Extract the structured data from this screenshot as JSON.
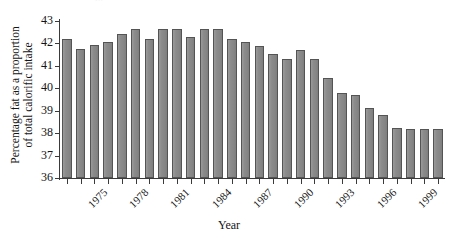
{
  "figure": {
    "top_remnant_text": "···",
    "background_color": "#ffffff",
    "bar_fill_color": "#8d8d8d",
    "bar_border_color": "#545454",
    "axis_color": "#3a3a3a"
  },
  "axis_titles": {
    "y_line1": "Percentage fat as a proportion",
    "y_line2": "of total calorific intake",
    "x": "Year"
  },
  "chart_data": {
    "type": "bar",
    "title": "",
    "subtitle": "",
    "xlabel": "Year",
    "ylabel": "Percentage fat as a proportion of total calorific intake",
    "ylim": [
      36,
      43
    ],
    "yticks": [
      36,
      37,
      38,
      39,
      40,
      41,
      42,
      43
    ],
    "ytick_labels": [
      "36",
      "37",
      "38",
      "39",
      "40",
      "41",
      "42",
      "43"
    ],
    "grid": false,
    "legend": null,
    "legend_position": "none",
    "xtick_labels_shown": [
      "1975",
      "1978",
      "1981",
      "1984",
      "1987",
      "1990",
      "1993",
      "1996",
      "1999"
    ],
    "xtick_label_rotation": -45,
    "categories": [
      "1975",
      "1976",
      "1977",
      "1978",
      "1979",
      "1980",
      "1981",
      "1982",
      "1983",
      "1984",
      "1985",
      "1986",
      "1987",
      "1988",
      "1989",
      "1990",
      "1991",
      "1992",
      "1993",
      "1994",
      "1995",
      "1996",
      "1997",
      "1998",
      "1999",
      "2000",
      "2001",
      "2002"
    ],
    "values": [
      42.2,
      41.75,
      41.95,
      42.05,
      42.4,
      42.65,
      42.2,
      42.65,
      42.65,
      42.3,
      42.65,
      42.65,
      42.2,
      42.05,
      41.9,
      41.55,
      41.3,
      41.7,
      41.3,
      40.45,
      39.8,
      39.7,
      39.1,
      38.8,
      38.25,
      38.2,
      38.2,
      38.2
    ],
    "series": [
      {
        "name": "Percentage fat of total calorific intake",
        "values": [
          42.2,
          41.75,
          41.95,
          42.05,
          42.4,
          42.65,
          42.2,
          42.65,
          42.65,
          42.3,
          42.65,
          42.65,
          42.2,
          42.05,
          41.9,
          41.55,
          41.3,
          41.7,
          41.3,
          40.45,
          39.8,
          39.7,
          39.1,
          38.8,
          38.25,
          38.2,
          38.2,
          38.2
        ]
      }
    ]
  }
}
